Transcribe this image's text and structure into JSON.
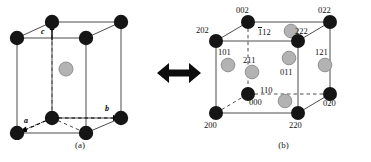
{
  "figure": {
    "type": "crystal-unit-cell-diagram",
    "relation_icon": "double-headed-horizontal-arrow",
    "colors": {
      "corner_atom": "#151515",
      "interior_atom": "#b3b3b3",
      "interior_atom_stroke": "#8f8f8f",
      "solid_edge": "#4d4d4d",
      "dashed_edge": "#4d4d4d",
      "background": "#ffffff",
      "text": "#111111"
    }
  },
  "panel_a": {
    "caption": "(a)",
    "axis_labels": [
      {
        "name": "c",
        "text": "c",
        "direction": "up"
      },
      {
        "name": "b",
        "text": "b",
        "direction": "right"
      },
      {
        "name": "a",
        "text": "a",
        "direction": "down-left"
      }
    ],
    "corner_atom_count": 8,
    "interior_atom_count": 1
  },
  "panel_b": {
    "caption": "(b)",
    "corner_atoms": [
      {
        "label": "002",
        "position": "top-back-left-raised"
      },
      {
        "label": "022",
        "position": "top-back-right"
      },
      {
        "label": "202",
        "position": "top-front-left"
      },
      {
        "label": "222",
        "position": "top-front-right"
      },
      {
        "label": "200",
        "position": "bottom-front-left"
      },
      {
        "label": "220",
        "position": "bottom-front-right"
      },
      {
        "label": "020",
        "position": "bottom-back-right"
      },
      {
        "label": "000",
        "position": "bottom-back-left"
      }
    ],
    "interior_atoms": [
      {
        "label": "112",
        "overline_digits": 1
      },
      {
        "label": "101",
        "overline_digits": 0
      },
      {
        "label": "211",
        "overline_digits": 0
      },
      {
        "label": "011",
        "overline_digits": 0
      },
      {
        "label": "121",
        "overline_digits": 0
      },
      {
        "label": "110",
        "overline_digits": 0
      }
    ],
    "labels": {
      "l002": "002",
      "l022": "022",
      "l202": "202",
      "l222": "222",
      "l200": "200",
      "l220": "220",
      "l020": "020",
      "l000": "000",
      "l112_bar": "1",
      "l112_rest": "12",
      "l101": "101",
      "l211": "211",
      "l011": "011",
      "l121": "121",
      "l110": "110"
    }
  }
}
